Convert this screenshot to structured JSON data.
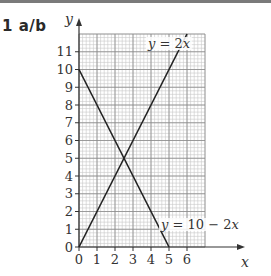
{
  "question": {
    "label": "1  a/b"
  },
  "chart_data": {
    "type": "line",
    "title": "",
    "xlabel": "x",
    "ylabel": "y",
    "xlim": [
      0,
      7
    ],
    "ylim": [
      0,
      12
    ],
    "x_ticks": [
      0,
      1,
      2,
      3,
      4,
      5,
      6
    ],
    "y_ticks": [
      0,
      1,
      2,
      3,
      4,
      5,
      6,
      7,
      8,
      9,
      10,
      11
    ],
    "grid": {
      "major": 1,
      "minor_subdivisions": 5
    },
    "series": [
      {
        "name": "y = 2x",
        "label_parts": [
          "y",
          " = 2",
          "x"
        ],
        "points": [
          [
            0,
            0
          ],
          [
            6,
            12
          ]
        ]
      },
      {
        "name": "y = 10 − 2x",
        "label_parts": [
          "y",
          " = 10 − 2",
          "x"
        ],
        "points": [
          [
            0,
            10
          ],
          [
            5,
            0
          ]
        ]
      }
    ],
    "intersection": [
      2.5,
      5
    ]
  },
  "layout": {
    "origin_px": [
      79,
      247
    ],
    "px_per_x": 18,
    "px_per_y": 17.75,
    "colors": {
      "line": "#222222",
      "grid_minor": "#c8c8c8",
      "grid_major": "#8a8a8a",
      "axis": "#333333"
    }
  }
}
